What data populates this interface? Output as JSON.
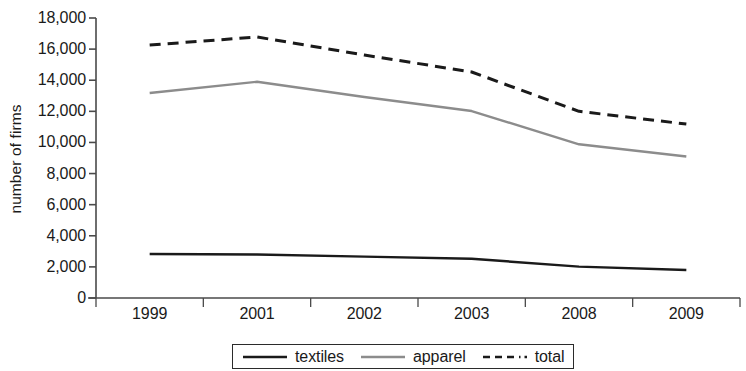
{
  "chart_data": {
    "type": "line",
    "title": "",
    "xlabel": "",
    "ylabel": "number of firms",
    "categories": [
      "1999",
      "2001",
      "2002",
      "2003",
      "2008",
      "2009"
    ],
    "ylim": [
      0,
      18000
    ],
    "yticks": [
      0,
      2000,
      4000,
      6000,
      8000,
      10000,
      12000,
      14000,
      16000,
      18000
    ],
    "ytick_labels": [
      "0",
      "2,000",
      "4,000",
      "6,000",
      "8,000",
      "10,000",
      "12,000",
      "14,000",
      "16,000",
      "18,000"
    ],
    "grid": false,
    "legend_position": "bottom",
    "series": [
      {
        "name": "textiles",
        "style": "solid",
        "color": "#1a1a1a",
        "values": [
          2830,
          2800,
          2660,
          2520,
          2020,
          1800
        ]
      },
      {
        "name": "apparel",
        "style": "solid",
        "color": "#8c8c8c",
        "values": [
          13180,
          13900,
          12920,
          12020,
          9880,
          9100
        ]
      },
      {
        "name": "total",
        "style": "dashed",
        "color": "#1a1a1a",
        "values": [
          16260,
          16780,
          15620,
          14530,
          12000,
          11180
        ]
      }
    ]
  },
  "legend": {
    "items": [
      {
        "label": "textiles",
        "style": "solid",
        "color": "#1a1a1a"
      },
      {
        "label": "apparel",
        "style": "solid",
        "color": "#8c8c8c"
      },
      {
        "label": "total",
        "style": "dashdot",
        "color": "#1a1a1a"
      }
    ]
  },
  "axes": {
    "axis_color": "#4a4a4a"
  }
}
